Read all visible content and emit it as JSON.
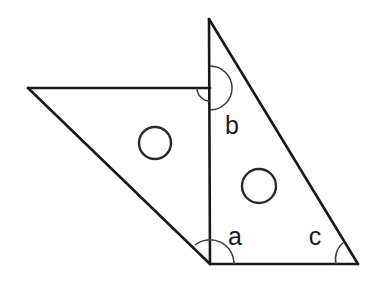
{
  "figure": {
    "background_color": "#ffffff",
    "line_color": "#1a1a1a",
    "arc_color": "#3c3c3c",
    "circle_color": "#2a2a2a",
    "width": 372,
    "height": 284
  },
  "points": {
    "apex": {
      "name": "triangle-apex",
      "x": 209,
      "y": 19
    },
    "bottom_left": {
      "name": "triangle-bottom-left",
      "x": 210,
      "y": 264
    },
    "bottom_right": {
      "name": "triangle-bottom-right",
      "x": 358,
      "y": 264
    },
    "left_vertex": {
      "name": "parallelogram-left-vertex",
      "x": 28,
      "y": 88
    },
    "junction": {
      "name": "vertical-horizontal-junction",
      "x": 210,
      "y": 88
    }
  },
  "edges": [
    {
      "name": "triangle-hypotenuse",
      "from": "apex",
      "to": "bottom_right",
      "d": "M 209 19 L 358 264"
    },
    {
      "name": "triangle-vertical-side",
      "from": "apex",
      "to": "bottom_left",
      "d": "M 209 19 L 210 264"
    },
    {
      "name": "triangle-base",
      "from": "bottom_left",
      "to": "bottom_right",
      "d": "M 210 264 L 358 264"
    },
    {
      "name": "parallelogram-top-edge",
      "from": "left_vertex",
      "to": "junction",
      "d": "M 28 88 L 210 88"
    },
    {
      "name": "parallelogram-left-edge",
      "from": "left_vertex",
      "to": "bottom_left",
      "d": "M 28 88 L 210 264"
    }
  ],
  "angle_arcs": [
    {
      "name": "arc-at-junction-large",
      "cx": 210,
      "cy": 88,
      "r": 22,
      "d": "M 210 66 A 22 22 0 0 1 210 110"
    },
    {
      "name": "arc-at-junction-small",
      "cx": 210,
      "cy": 88,
      "r": 13,
      "d": "M 197 88 A 13 13 0 0 0 210 101"
    },
    {
      "name": "arc-at-bottom-left-vertex",
      "cx": 210,
      "cy": 264,
      "r": 24,
      "d": "M 195 245 A 24 24 0 0 1 234 264"
    },
    {
      "name": "arc-at-bottom-right-vertex",
      "cx": 358,
      "cy": 264,
      "r": 22,
      "d": "M 336 264 A 22 22 0 0 1 344 242"
    }
  ],
  "circles": [
    {
      "name": "hole-circle-left",
      "cx": 155,
      "cy": 143,
      "r": 16
    },
    {
      "name": "hole-circle-right",
      "cx": 259,
      "cy": 186,
      "r": 17
    }
  ],
  "labels": {
    "b": {
      "text": "b",
      "x": 232,
      "y": 134,
      "description": "angle at the junction of vertical side and horizontal edge, inside triangle"
    },
    "a": {
      "text": "a",
      "x": 235,
      "y": 245,
      "description": "angle at the bottom-left vertex of the triangle"
    },
    "c": {
      "text": "c",
      "x": 315,
      "y": 245,
      "description": "angle at the bottom-right vertex of the triangle"
    }
  }
}
